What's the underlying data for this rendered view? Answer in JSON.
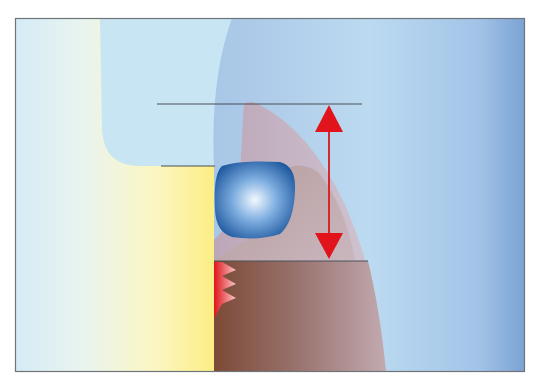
{
  "diagram": {
    "frame": {
      "x": 15,
      "y": 18,
      "width": 510,
      "height": 354,
      "border_color": "#6f7478"
    },
    "colors": {
      "background_left": "#d6ecf6",
      "yellow": "#fbf08a",
      "light_blue_region": "#c6e4f3",
      "right_blue_top": "#a9c9e8",
      "right_blue_edge": "#7ea6d6",
      "mauve": "#c7aeb9",
      "brown": "#8a5a48",
      "brown_light": "#b89a98",
      "blob_dark": "#1f5aa0",
      "blob_light": "#eef6ff",
      "arrow_red": "#e0141a",
      "line": "#4a4f57"
    },
    "reference_lines": [
      {
        "name": "top-reference-line",
        "x1": 157,
        "x2": 362,
        "y": 104
      },
      {
        "name": "middle-reference-line",
        "x1": 161,
        "x2": 215,
        "y": 166
      },
      {
        "name": "bottom-reference-line",
        "x1": 214,
        "x2": 368,
        "y": 261
      }
    ],
    "double_arrow": {
      "x": 329,
      "y_top": 104,
      "y_bottom": 260
    },
    "blob": {
      "x": 214,
      "y": 163,
      "width": 82,
      "height": 76
    },
    "sawtooth": {
      "x": 214,
      "y_top": 262,
      "y_bottom": 318,
      "teeth": 3
    }
  }
}
